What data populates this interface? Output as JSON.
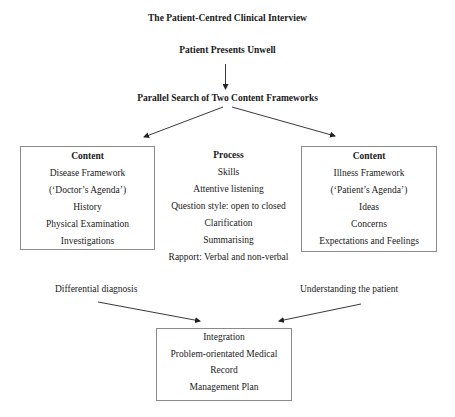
{
  "title": "The Patient-Centred Clinical Interview",
  "start": "Patient Presents Unwell",
  "parallel": "Parallel Search of Two Content Frameworks",
  "left_box": {
    "heading": "Content",
    "items": [
      "Disease Framework",
      "(‘Doctor’s Agenda’)",
      "History",
      "Physical Examination",
      "Investigations"
    ]
  },
  "process": {
    "heading": "Process",
    "items": [
      "Skills",
      "Attentive listening",
      "Question style: open to closed",
      "Clarification",
      "Summarising",
      "Rapport: Verbal and non-verbal"
    ]
  },
  "right_box": {
    "heading": "Content",
    "items": [
      "Illness Framework",
      "(‘Patient’s Agenda’)",
      "Ideas",
      "Concerns",
      "Expectations and Feelings"
    ]
  },
  "left_outcome": "Differential diagnosis",
  "right_outcome": "Understanding the patient",
  "bottom_box": {
    "items": [
      "Integration",
      "Problem-orientated Medical",
      "Record",
      "Management Plan"
    ]
  },
  "colors": {
    "text": "#1a1a1a",
    "border": "#8a8a8a",
    "arrow": "#222222"
  }
}
